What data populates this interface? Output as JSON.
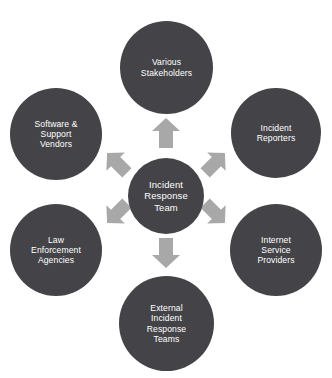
{
  "diagram": {
    "type": "hub-and-spoke",
    "background_color": "#ffffff",
    "node_color": "#444448",
    "node_text_color": "#ffffff",
    "arrow_color": "#a8a8a8",
    "center": {
      "id": "incident-response-team",
      "label": "Incident\nResponse\nTeam"
    },
    "nodes": [
      {
        "id": "various-stakeholders",
        "label": "Various\nStakeholders",
        "position": "top"
      },
      {
        "id": "incident-reporters",
        "label": "Incident\nReporters",
        "position": "top-right"
      },
      {
        "id": "internet-service-providers",
        "label": "Internet\nService\nProviders",
        "position": "bottom-right"
      },
      {
        "id": "external-incident-response-teams",
        "label": "External\nIncident\nResponse\nTeams",
        "position": "bottom"
      },
      {
        "id": "law-enforcement-agencies",
        "label": "Law\nEnforcement\nAgencies",
        "position": "bottom-left"
      },
      {
        "id": "software-support-vendors",
        "label": "Software &\nSupport\nVendors",
        "position": "top-left"
      }
    ],
    "arrows": [
      {
        "id": "arrow-up",
        "direction": "up",
        "from": "incident-response-team",
        "to": "various-stakeholders"
      },
      {
        "id": "arrow-up-right",
        "direction": "up-right",
        "from": "incident-response-team",
        "to": "incident-reporters"
      },
      {
        "id": "arrow-down-right",
        "direction": "down-right",
        "from": "incident-response-team",
        "to": "internet-service-providers"
      },
      {
        "id": "arrow-down",
        "direction": "down",
        "from": "incident-response-team",
        "to": "external-incident-response-teams"
      },
      {
        "id": "arrow-down-left",
        "direction": "down-left",
        "from": "incident-response-team",
        "to": "law-enforcement-agencies"
      },
      {
        "id": "arrow-up-left",
        "direction": "up-left",
        "from": "incident-response-team",
        "to": "software-support-vendors"
      }
    ]
  }
}
